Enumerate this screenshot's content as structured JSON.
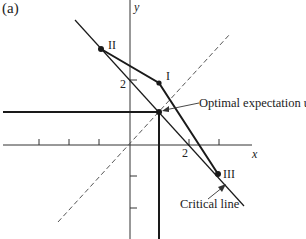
{
  "figure": {
    "panel_label": "(a)",
    "axes": {
      "x_label": "x",
      "y_label": "y",
      "y_tick_label": "2",
      "x_tick_label": "2"
    },
    "points": {
      "I": {
        "label": "I"
      },
      "II": {
        "label": "II"
      },
      "III": {
        "label": "III"
      }
    },
    "annotations": {
      "optimal_expectation": "Optimal expectation u",
      "optimal_subscript": "0",
      "critical_line": "Critical line"
    },
    "colors": {
      "ink": "#1a1a1a",
      "dashed": "#555555",
      "background": "#ffffff"
    }
  }
}
